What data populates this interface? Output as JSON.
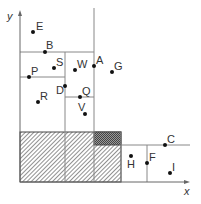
{
  "axes": {
    "x_label": "x",
    "y_label": "y"
  },
  "points": [
    {
      "name": "E",
      "x": 33,
      "y": 32,
      "lx": 36,
      "ly": 30
    },
    {
      "name": "B",
      "x": 45,
      "y": 52,
      "lx": 46,
      "ly": 49
    },
    {
      "name": "S",
      "x": 54,
      "y": 68,
      "lx": 56,
      "ly": 66
    },
    {
      "name": "P",
      "x": 29,
      "y": 77,
      "lx": 31,
      "ly": 75
    },
    {
      "name": "W",
      "x": 75,
      "y": 70,
      "lx": 77,
      "ly": 68
    },
    {
      "name": "A",
      "x": 94,
      "y": 66,
      "lx": 96,
      "ly": 64
    },
    {
      "name": "G",
      "x": 112,
      "y": 72,
      "lx": 114,
      "ly": 70
    },
    {
      "name": "D",
      "x": 65,
      "y": 86,
      "lx": 56,
      "ly": 94
    },
    {
      "name": "R",
      "x": 38,
      "y": 102,
      "lx": 40,
      "ly": 100
    },
    {
      "name": "Q",
      "x": 80,
      "y": 97,
      "lx": 82,
      "ly": 95
    },
    {
      "name": "V",
      "x": 85,
      "y": 114,
      "lx": 78,
      "ly": 111
    },
    {
      "name": "C",
      "x": 165,
      "y": 145,
      "lx": 167,
      "ly": 143
    },
    {
      "name": "H",
      "x": 131,
      "y": 156,
      "lx": 127,
      "ly": 168
    },
    {
      "name": "F",
      "x": 147,
      "y": 163,
      "lx": 149,
      "ly": 161
    },
    {
      "name": "I",
      "x": 170,
      "y": 173,
      "lx": 172,
      "ly": 171
    }
  ],
  "colors": {
    "line": "#888888",
    "dot": "#111111",
    "text": "#333333"
  }
}
